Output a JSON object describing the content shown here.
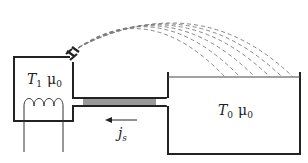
{
  "diagram": {
    "left_vessel": {
      "temp_symbol": "T",
      "temp_sub": "1",
      "mu_symbol": "μ",
      "mu_sub": "0"
    },
    "right_vessel": {
      "temp_symbol": "T",
      "temp_sub": "0",
      "mu_symbol": "μ",
      "mu_sub": "0"
    },
    "flow_label": {
      "symbol": "j",
      "sub": "s"
    },
    "colors": {
      "stroke": "#222222",
      "superleak": "#999999",
      "jet": "#777777"
    }
  }
}
